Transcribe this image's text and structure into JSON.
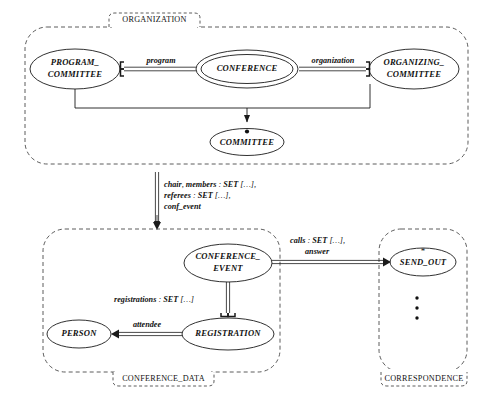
{
  "diagram": {
    "background": "#ffffff",
    "line_color": "#1a1a1a",
    "dashed_color": "#4a4a4a"
  },
  "clusters": [
    {
      "id": "organization",
      "label": "ORGANIZATION"
    },
    {
      "id": "conference_data",
      "label": "CONFERENCE_DATA"
    },
    {
      "id": "correspondence",
      "label": "CORRESPONDENCE"
    }
  ],
  "entities": [
    {
      "id": "program_committee",
      "line1": "PROGRAM_",
      "line2": "COMMITTEE",
      "double": false
    },
    {
      "id": "conference",
      "line1": "CONFERENCE",
      "line2": "",
      "double": true
    },
    {
      "id": "organizing_committee",
      "line1": "ORGANIZING_",
      "line2": "COMMITTEE",
      "double": false
    },
    {
      "id": "committee",
      "line1": "COMMITTEE",
      "line2": "",
      "double": false
    },
    {
      "id": "conference_event",
      "line1": "CONFERENCE_",
      "line2": "EVENT",
      "double": false
    },
    {
      "id": "registration",
      "line1": "REGISTRATION",
      "line2": "",
      "double": false
    },
    {
      "id": "person",
      "line1": "PERSON",
      "line2": "",
      "double": false
    },
    {
      "id": "send_out",
      "line1": "SEND_OUT",
      "line2": "",
      "double": false
    }
  ],
  "relations": [
    {
      "id": "program",
      "label": "program"
    },
    {
      "id": "organization",
      "label": "organization"
    },
    {
      "id": "attendee",
      "label": "attendee"
    }
  ],
  "feature_annotations": [
    {
      "id": "conference-features",
      "lines": [
        [
          {
            "t": "chair",
            "i": true
          },
          {
            "t": ", ",
            "i": false
          },
          {
            "t": "members",
            "i": true
          },
          {
            "t": " : ",
            "i": false
          },
          {
            "t": "SET",
            "i": true
          },
          {
            "t": " […],",
            "i": false
          }
        ],
        [
          {
            "t": "referees",
            "i": true
          },
          {
            "t": " : ",
            "i": false
          },
          {
            "t": "SET",
            "i": true
          },
          {
            "t": " […],",
            "i": false
          }
        ],
        [
          {
            "t": "conf_event",
            "i": true
          }
        ]
      ]
    },
    {
      "id": "calls-features",
      "lines": [
        [
          {
            "t": "calls",
            "i": true
          },
          {
            "t": " : ",
            "i": false
          },
          {
            "t": "SET",
            "i": true
          },
          {
            "t": " […],",
            "i": false
          }
        ],
        [
          {
            "t": "answer",
            "i": true
          }
        ]
      ]
    },
    {
      "id": "registrations-features",
      "lines": [
        [
          {
            "t": "registrations",
            "i": true
          },
          {
            "t": " : ",
            "i": false
          },
          {
            "t": "SET",
            "i": true
          },
          {
            "t": " […]",
            "i": false
          }
        ]
      ]
    }
  ],
  "markers": {
    "committee_dot": "●",
    "send_out_star": "*",
    "correspondence_ellipsis": [
      "•",
      "•",
      "•"
    ]
  }
}
